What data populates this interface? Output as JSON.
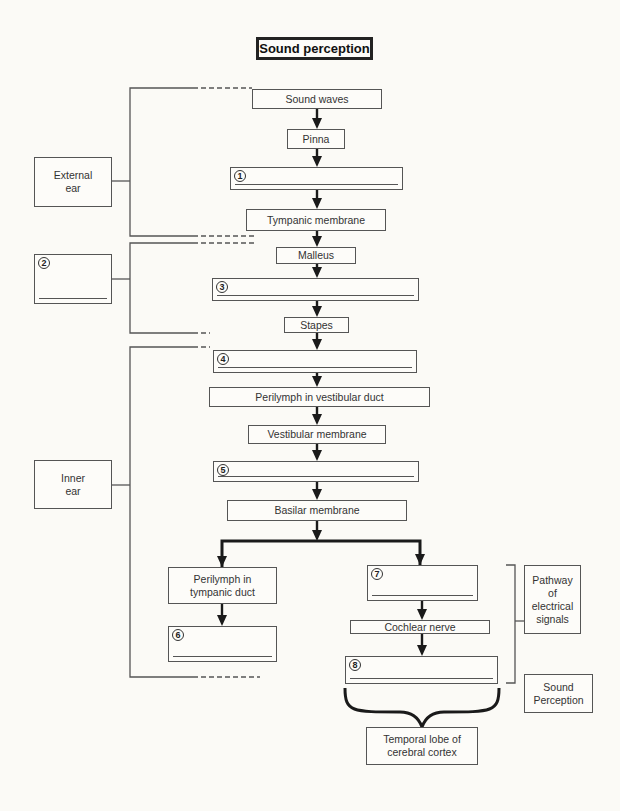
{
  "title": "Sound perception",
  "flow": {
    "sound_waves": "Sound waves",
    "pinna": "Pinna",
    "blank_1": {
      "number": "1",
      "answer": ""
    },
    "tympanic_membrane": "Tympanic membrane",
    "malleus": "Malleus",
    "blank_3": {
      "number": "3",
      "answer": ""
    },
    "stapes": "Stapes",
    "blank_4": {
      "number": "4",
      "answer": ""
    },
    "perilymph_vestibular": "Perilymph in vestibular duct",
    "vestibular_membrane": "Vestibular membrane",
    "blank_5": {
      "number": "5",
      "answer": ""
    },
    "basilar_membrane": "Basilar membrane",
    "left_branch": {
      "perilymph_tympanic": "Perilymph in tympanic duct",
      "blank_6": {
        "number": "6",
        "answer": ""
      }
    },
    "right_branch": {
      "blank_7": {
        "number": "7",
        "answer": ""
      },
      "cochlear_nerve": "Cochlear nerve",
      "blank_8": {
        "number": "8",
        "answer": ""
      }
    },
    "temporal_lobe": "Temporal lobe of cerebral cortex"
  },
  "regions": {
    "external_ear": "External ear",
    "blank_2": {
      "number": "2",
      "answer": ""
    },
    "inner_ear": "Inner ear"
  },
  "side_labels": {
    "pathway": "Pathway of electrical signals",
    "sound_perception": "Sound Perception"
  },
  "colors": {
    "background": "#fbfaf6",
    "line": "#555555",
    "arrow": "#1a1a1a",
    "title_border": "#222222"
  }
}
